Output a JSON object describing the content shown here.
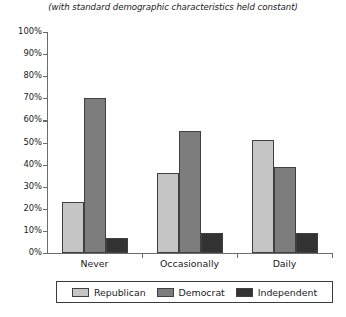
{
  "chart_data": {
    "type": "bar",
    "title": "",
    "subtitle": "(with standard demographic characteristics held constant)",
    "xlabel": "",
    "ylabel": "",
    "categories": [
      "Never",
      "Occasionally",
      "Daily"
    ],
    "series": [
      {
        "name": "Republican",
        "color": "#c5c5c5",
        "values": [
          23,
          36,
          51
        ]
      },
      {
        "name": "Democrat",
        "color": "#7d7d7d",
        "values": [
          70,
          55,
          39
        ]
      },
      {
        "name": "Independent",
        "color": "#333333",
        "values": [
          7,
          9,
          9
        ]
      }
    ],
    "ylim": [
      0,
      100
    ],
    "ytick_labels": [
      "0%",
      "10%",
      "20%",
      "30%",
      "40%",
      "50%",
      "60%",
      "70%",
      "80%",
      "90%",
      "100%"
    ],
    "ytick_values": [
      0,
      10,
      20,
      30,
      40,
      50,
      60,
      70,
      80,
      90,
      100
    ],
    "grid": false,
    "legend_position": "bottom",
    "bar_outline_color": "#404040",
    "axis_color": "#6b6b6b"
  },
  "legend": {
    "items": [
      {
        "label": "Republican"
      },
      {
        "label": "Democrat"
      },
      {
        "label": "Independent"
      }
    ]
  }
}
